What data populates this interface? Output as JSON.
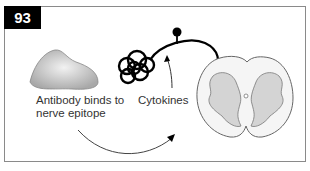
{
  "figure": {
    "number": "93",
    "labels": {
      "antibody": "Antibody binds to nerve epitope",
      "antibody_line1": "Antibody binds to",
      "antibody_line2": "nerve epitope",
      "cytokines": "Cytokines"
    },
    "elements": [
      "antigen-blob",
      "tangled-neuron",
      "neuron-axon",
      "spinal-cord-cross-section",
      "curved-arrow",
      "cytokine-arrow"
    ],
    "colors": {
      "border": "#8a8a8a",
      "badge": "#000000",
      "blob": "#b8b8b8",
      "cord_gray": "#d4d4d4",
      "cord_outline": "#666666"
    }
  }
}
